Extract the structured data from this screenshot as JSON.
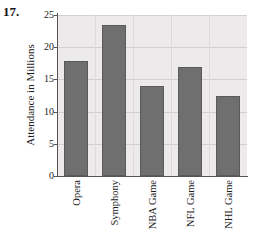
{
  "problem": {
    "number": "17."
  },
  "chart_data": {
    "type": "bar",
    "title": "",
    "xlabel": "",
    "ylabel": "Attendance in Millions",
    "categories": [
      "Opera",
      "Symphony",
      "NBA Game",
      "NFL Game",
      "NHL Game"
    ],
    "values": [
      17.8,
      23.5,
      14.0,
      17.0,
      12.4
    ],
    "ylim": [
      0,
      25
    ],
    "yticks": [
      0,
      5,
      10,
      15,
      20,
      25
    ],
    "ytick_labels": [
      "0",
      "5",
      "10",
      "15",
      "20",
      "25"
    ],
    "grid": true,
    "legend": null,
    "bar_color": "#6f6f6f",
    "plot_background": "#eceaea",
    "axis_color": "#555555",
    "gridline_color": "#d2d0d0"
  }
}
